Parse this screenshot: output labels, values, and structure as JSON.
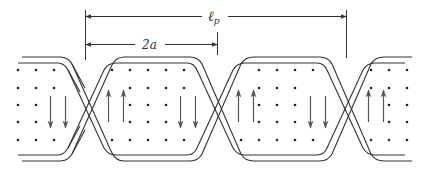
{
  "figure": {
    "labels": {
      "period": "ℓ",
      "period_sub": "p",
      "half_width": "2a"
    },
    "colors": {
      "line": "#333333",
      "dot": "#222222",
      "arrow": "#555555",
      "background": "#ffffff"
    },
    "sections": [
      {
        "index": 0,
        "arrow_direction": "down"
      },
      {
        "index": 1,
        "arrow_direction": "up"
      },
      {
        "index": 2,
        "arrow_direction": "down"
      },
      {
        "index": 3,
        "arrow_direction": "up"
      },
      {
        "index": 4,
        "arrow_direction": "down"
      },
      {
        "index": 5,
        "arrow_direction": "up"
      }
    ]
  }
}
